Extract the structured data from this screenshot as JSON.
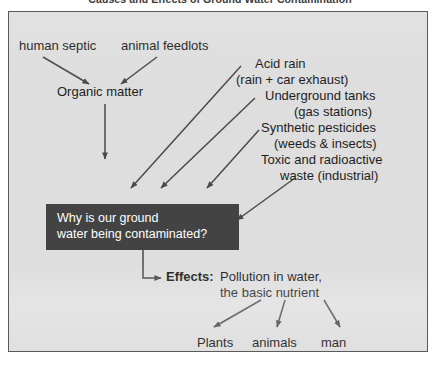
{
  "document": {
    "title": "Causes and Effects of Ground Water Contamination"
  },
  "diagram": {
    "type": "concept-map",
    "causes_left": {
      "sources": [
        {
          "label": "human septic"
        },
        {
          "label": "animal feedlots"
        }
      ],
      "intermediate": "Organic matter"
    },
    "causes_right": [
      {
        "label": "Acid rain",
        "detail": "(rain + car exhaust)"
      },
      {
        "label": "Underground tanks",
        "detail": "(gas stations)"
      },
      {
        "label": "Synthetic pesticides",
        "detail": "(weeds & insects)"
      },
      {
        "label": "Toxic and radioactive",
        "detail": "waste (industrial)"
      }
    ],
    "central_question": "Why is our ground\nwater being contaminated?",
    "effects": {
      "label": "Effects:",
      "body": "Pollution in water,\nthe basic nutrient",
      "receptors": [
        {
          "label": "Plants"
        },
        {
          "label": "animals"
        },
        {
          "label": "man"
        }
      ]
    },
    "colors": {
      "panel_background": "#dedede",
      "panel_border": "#5a5a5a",
      "question_box_fill": "#434343",
      "question_box_text": "#ffffff",
      "arrow": "#4a4a4a",
      "text": "#1d1d1d"
    }
  }
}
